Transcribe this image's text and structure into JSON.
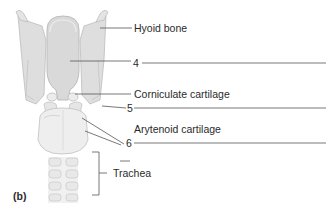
{
  "figure": {
    "panel": "(b)",
    "colors": {
      "cartilage_fill": "#e6e6e6",
      "cartilage_stroke": "#bdbdbd",
      "shadow": "#cfcfcf",
      "leader_line": "#555555",
      "text": "#2a2a2a"
    }
  },
  "labels": [
    {
      "id": "hyoid",
      "text": "Hyoid bone"
    },
    {
      "id": "num4",
      "text": "4"
    },
    {
      "id": "corniculate",
      "text": "Corniculate cartilage"
    },
    {
      "id": "num5",
      "text": "5"
    },
    {
      "id": "arytenoid",
      "text": "Arytenoid cartilage"
    },
    {
      "id": "num6",
      "text": "6"
    },
    {
      "id": "trachea",
      "text": "Trachea"
    }
  ]
}
